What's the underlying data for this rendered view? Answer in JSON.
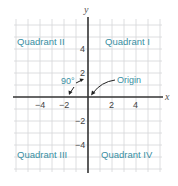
{
  "diagram": {
    "axes": {
      "x_label": "x",
      "y_label": "y",
      "x_ticks": [
        {
          "value": -4,
          "label": "−4"
        },
        {
          "value": -2,
          "label": "−2"
        },
        {
          "value": 2,
          "label": "2"
        },
        {
          "value": 4,
          "label": "4"
        }
      ],
      "y_ticks": [
        {
          "value": 4,
          "label": "4"
        },
        {
          "value": 2,
          "label": "2"
        },
        {
          "value": -2,
          "label": "−2"
        },
        {
          "value": -4,
          "label": "−4"
        }
      ],
      "range": {
        "x": [
          -6,
          6
        ],
        "y": [
          -6,
          6
        ]
      }
    },
    "quadrants": {
      "q1": "Quadrant I",
      "q2": "Quadrant II",
      "q3": "Quadrant III",
      "q4": "Quadrant IV"
    },
    "annotations": {
      "right_angle": "90°",
      "origin": "Origin"
    },
    "colors": {
      "quadrant_text": "#3a8fa3",
      "axis": "#333333",
      "grid": "#d4d6d8"
    }
  }
}
